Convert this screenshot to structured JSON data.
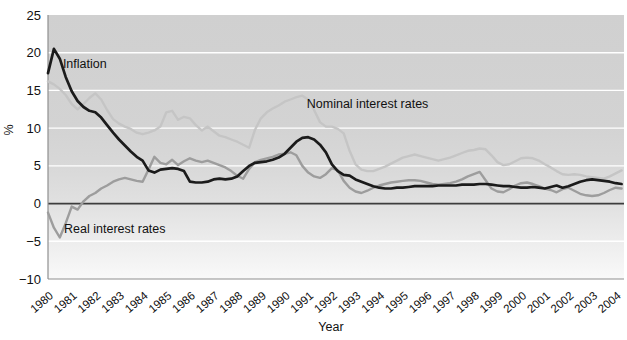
{
  "figure": {
    "width": 627,
    "height": 340,
    "background": "#ffffff"
  },
  "chart_data": {
    "type": "line",
    "title": "",
    "xlabel": "Year",
    "ylabel": "%",
    "x_start": 1980,
    "x_step": 0.25,
    "xlim": [
      1980,
      2004.35
    ],
    "ylim": [
      -10,
      25
    ],
    "grid": "horizontal white gridlines every 5 units, dark line at zero",
    "legend_position": "inline-annotations",
    "y_ticks": [
      25,
      20,
      15,
      10,
      5,
      0,
      -5,
      -10
    ],
    "y_tick_labels": [
      "25",
      "20",
      "15",
      "10",
      "5",
      "0",
      "−5",
      "−10"
    ],
    "x_tick_labels": [
      "1980",
      "1981",
      "1982",
      "1983",
      "1984",
      "1985",
      "1986",
      "1987",
      "1988",
      "1989",
      "1990",
      "1991",
      "1992",
      "1993",
      "1994",
      "1995",
      "1996",
      "1997",
      "1998",
      "1999",
      "2000",
      "2001",
      "2002",
      "2003",
      "2004"
    ],
    "series": [
      {
        "name": "Nominal interest rates",
        "key": "nominal-interest-rates",
        "color": "#c5c5c5",
        "width": 2.4,
        "values": [
          16.2,
          15.8,
          15.2,
          14.4,
          13.2,
          12.5,
          13.2,
          14.0,
          14.6,
          13.8,
          12.4,
          11.2,
          10.6,
          10.2,
          9.9,
          9.4,
          9.2,
          9.4,
          9.7,
          10.2,
          12.1,
          12.3,
          11.1,
          11.5,
          11.3,
          10.4,
          9.7,
          10.2,
          9.6,
          9.0,
          8.8,
          8.5,
          8.2,
          7.8,
          7.4,
          9.8,
          11.3,
          12.1,
          12.6,
          13.0,
          13.5,
          13.8,
          14.1,
          14.3,
          13.8,
          12.4,
          10.8,
          10.2,
          10.2,
          9.9,
          9.3,
          7.0,
          5.2,
          4.5,
          4.3,
          4.3,
          4.6,
          4.9,
          5.3,
          5.7,
          6.1,
          6.3,
          6.5,
          6.3,
          6.1,
          5.9,
          5.7,
          5.9,
          6.1,
          6.4,
          6.7,
          7.0,
          7.1,
          7.3,
          7.2,
          6.4,
          5.5,
          5.1,
          5.2,
          5.6,
          6.0,
          6.1,
          6.0,
          5.7,
          5.2,
          4.8,
          4.3,
          3.9,
          3.8,
          3.9,
          3.8,
          3.6,
          3.5,
          3.4,
          3.3,
          3.6,
          4.0,
          4.4
        ]
      },
      {
        "name": "Real interest rates",
        "key": "real-interest-rates",
        "color": "#9d9d9d",
        "width": 2.4,
        "values": [
          -1.2,
          -3.2,
          -4.5,
          -2.6,
          -0.4,
          -0.8,
          0.3,
          1.0,
          1.4,
          2.0,
          2.4,
          2.9,
          3.2,
          3.4,
          3.2,
          3.0,
          2.9,
          4.5,
          6.2,
          5.4,
          5.2,
          5.8,
          5.1,
          5.6,
          6.0,
          5.7,
          5.5,
          5.7,
          5.4,
          5.1,
          4.8,
          4.3,
          3.7,
          3.3,
          4.6,
          5.5,
          5.8,
          6.0,
          6.2,
          6.5,
          6.6,
          6.8,
          6.4,
          5.0,
          4.1,
          3.6,
          3.4,
          3.9,
          4.7,
          4.4,
          3.0,
          2.1,
          1.6,
          1.4,
          1.7,
          2.1,
          2.4,
          2.6,
          2.8,
          2.9,
          3.0,
          3.1,
          3.1,
          3.0,
          2.8,
          2.6,
          2.5,
          2.6,
          2.7,
          2.9,
          3.2,
          3.6,
          3.9,
          4.2,
          3.1,
          2.0,
          1.6,
          1.5,
          1.9,
          2.4,
          2.7,
          2.8,
          2.6,
          2.3,
          2.0,
          1.8,
          1.5,
          1.9,
          2.1,
          1.7,
          1.3,
          1.1,
          1.0,
          1.1,
          1.4,
          1.8,
          2.1,
          2.0
        ]
      },
      {
        "name": "Inflation",
        "key": "inflation",
        "color": "#1b1b1b",
        "width": 2.7,
        "values": [
          17.3,
          20.5,
          19.2,
          16.8,
          14.9,
          13.6,
          12.8,
          12.3,
          12.1,
          11.4,
          10.4,
          9.4,
          8.5,
          7.7,
          6.9,
          6.2,
          5.7,
          4.4,
          4.1,
          4.5,
          4.6,
          4.7,
          4.6,
          4.3,
          2.9,
          2.8,
          2.8,
          2.9,
          3.2,
          3.3,
          3.2,
          3.3,
          3.6,
          4.3,
          5.0,
          5.4,
          5.5,
          5.6,
          5.8,
          6.1,
          6.6,
          7.4,
          8.2,
          8.7,
          8.8,
          8.5,
          7.8,
          6.8,
          5.2,
          4.3,
          3.8,
          3.7,
          3.2,
          2.9,
          2.6,
          2.3,
          2.1,
          2.0,
          2.0,
          2.1,
          2.1,
          2.2,
          2.3,
          2.3,
          2.3,
          2.3,
          2.4,
          2.4,
          2.4,
          2.4,
          2.5,
          2.5,
          2.5,
          2.6,
          2.6,
          2.5,
          2.4,
          2.3,
          2.3,
          2.2,
          2.1,
          2.1,
          2.2,
          2.1,
          2.0,
          2.2,
          2.4,
          2.1,
          2.3,
          2.6,
          2.9,
          3.1,
          3.2,
          3.1,
          3.0,
          2.9,
          2.7,
          2.6
        ]
      }
    ],
    "annotations": [
      {
        "text": "Inflation",
        "series": "inflation",
        "year": 1980.63,
        "value": 18.0
      },
      {
        "text": "Nominal interest rates",
        "series": "nominal-interest-rates",
        "year": 1990.94,
        "value": 12.67
      },
      {
        "text": "Real interest rates",
        "series": "real-interest-rates",
        "year": 1980.68,
        "value": -3.9
      }
    ]
  },
  "colors": {
    "gridline": "#ffffff",
    "zero_line": "#3d3d3d",
    "spine": "#8f8f8f",
    "text": "#111111",
    "plot_gradient": [
      {
        "offset": 0.0,
        "color": "#d0d0d0"
      },
      {
        "offset": 0.43,
        "color": "#d3d3d3"
      },
      {
        "offset": 0.57,
        "color": "#d8d8d8"
      },
      {
        "offset": 0.72,
        "color": "#e1e1e1"
      },
      {
        "offset": 0.86,
        "color": "#ededed"
      },
      {
        "offset": 1.0,
        "color": "#f9f9f9"
      }
    ]
  },
  "layout": {
    "plot": {
      "left": 48,
      "top": 15,
      "right": 624,
      "bottom": 279
    },
    "font_sizes": {
      "y_tick": 13,
      "x_tick": 11.5,
      "axis_title": 12.5,
      "annotation": 12.5
    }
  }
}
